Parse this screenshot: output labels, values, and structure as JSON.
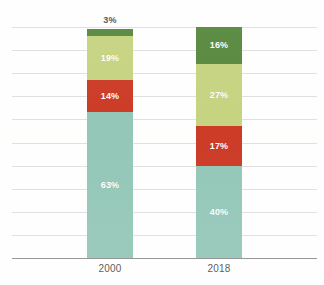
{
  "chart_data": {
    "type": "bar",
    "subtype": "stacked-column-100-percent",
    "title": "",
    "title_remnant_text": "",
    "xlabel": "",
    "ylabel": "",
    "ylim": [
      0,
      100
    ],
    "grid": true,
    "gridline_count": 10,
    "y_tick_labels": [],
    "legend": {
      "visible": false,
      "position": "none",
      "entries": []
    },
    "categories": [
      "2000",
      "2018"
    ],
    "series": [
      {
        "name": "series-1-teal",
        "color": "#8ec4b4",
        "values": [
          63,
          40
        ],
        "labels": [
          "63%",
          "40%"
        ],
        "label_color": "#ffffff",
        "label_position": "inside"
      },
      {
        "name": "series-2-red",
        "color": "#c9311b",
        "values": [
          14,
          17
        ],
        "labels": [
          "14%",
          "17%"
        ],
        "label_color": "#ffffff",
        "label_position": "inside"
      },
      {
        "name": "series-3-light-green",
        "color": "#c3d17a",
        "values": [
          19,
          27
        ],
        "labels": [
          "19%",
          "27%"
        ],
        "label_color": "#ffffff",
        "label_position": "inside"
      },
      {
        "name": "series-4-dark-green",
        "color": "#4e8234",
        "values": [
          3,
          16
        ],
        "labels": [
          "3%",
          "16%"
        ],
        "label_color": "#ffffff",
        "label_position": "mixed"
      }
    ],
    "bars": [
      {
        "category": "2000",
        "total": 99,
        "segments": [
          {
            "series": "series-4-dark-green",
            "value": 3,
            "label": "3%",
            "color": "#4e8234",
            "label_inside": false,
            "label_color": "#4a4a4a"
          },
          {
            "series": "series-3-light-green",
            "value": 19,
            "label": "19%",
            "color": "#c3d17a",
            "label_inside": true,
            "label_color": "#ffffff"
          },
          {
            "series": "series-2-red",
            "value": 14,
            "label": "14%",
            "color": "#c9311b",
            "label_inside": true,
            "label_color": "#ffffff"
          },
          {
            "series": "series-1-teal",
            "value": 63,
            "label": "63%",
            "color": "#8ec4b4",
            "label_inside": true,
            "label_color": "#ffffff"
          }
        ]
      },
      {
        "category": "2018",
        "total": 100,
        "segments": [
          {
            "series": "series-4-dark-green",
            "value": 16,
            "label": "16%",
            "color": "#4e8234",
            "label_inside": true,
            "label_color": "#ffffff"
          },
          {
            "series": "series-3-light-green",
            "value": 27,
            "label": "27%",
            "color": "#c3d17a",
            "label_inside": true,
            "label_color": "#ffffff"
          },
          {
            "series": "series-2-red",
            "value": 17,
            "label": "17%",
            "color": "#c9311b",
            "label_inside": true,
            "label_color": "#ffffff"
          },
          {
            "series": "series-1-teal",
            "value": 40,
            "label": "40%",
            "color": "#8ec4b4",
            "label_inside": true,
            "label_color": "#ffffff"
          }
        ]
      }
    ],
    "colors": {
      "teal": "#8ec4b4",
      "red": "#c9311b",
      "light_green": "#c3d17a",
      "dark_green": "#4e8234",
      "gridline": "#dededf",
      "axis_line": "#8b8b8e",
      "label_dark": "#4a4a4a",
      "label_light": "#ffffff",
      "background": "#fefefe"
    }
  }
}
